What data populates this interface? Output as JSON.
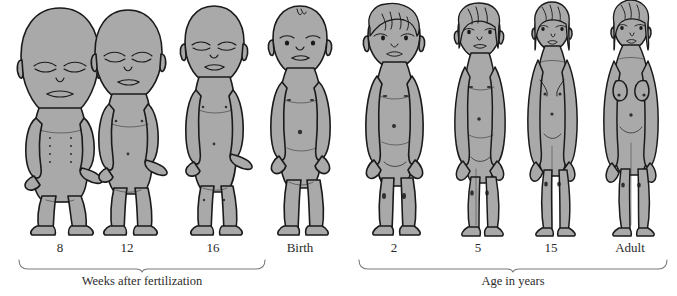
{
  "figure": {
    "background_color": "#ffffff",
    "body_fill_color": "#a9a9a9",
    "outline_color": "#1a1a1a",
    "label_color": "#2b2b2b",
    "baseline_y": 232
  },
  "stages": [
    {
      "id": "stage-8-weeks",
      "label": "8",
      "center_x": 60,
      "figure_height": 215,
      "head_ratio": 0.5,
      "type": "fetus",
      "description": "8-week fetus, head approximately half of total body length"
    },
    {
      "id": "stage-12-weeks",
      "label": "12",
      "center_x": 127,
      "figure_height": 212,
      "head_ratio": 0.4,
      "type": "fetus",
      "description": "12-week fetus"
    },
    {
      "id": "stage-16-weeks",
      "label": "16",
      "center_x": 213,
      "figure_height": 214,
      "head_ratio": 0.33,
      "type": "fetus",
      "description": "16-week fetus"
    },
    {
      "id": "stage-birth",
      "label": "Birth",
      "center_x": 300,
      "figure_height": 216,
      "head_ratio": 0.27,
      "type": "newborn",
      "description": "Newborn infant at birth"
    },
    {
      "id": "stage-2-years",
      "label": "2",
      "center_x": 394,
      "figure_height": 218,
      "head_ratio": 0.22,
      "type": "child",
      "description": "Child aged 2 years"
    },
    {
      "id": "stage-5-years",
      "label": "5",
      "center_x": 478,
      "figure_height": 219,
      "head_ratio": 0.18,
      "type": "child",
      "description": "Child aged 5 years"
    },
    {
      "id": "stage-15-years",
      "label": "15",
      "center_x": 551,
      "figure_height": 220,
      "head_ratio": 0.14,
      "type": "adolescent",
      "description": "Adolescent aged 15 years"
    },
    {
      "id": "stage-adult",
      "label": "Adult",
      "center_x": 630,
      "figure_height": 221,
      "head_ratio": 0.125,
      "type": "adult",
      "description": "Adult female"
    }
  ],
  "braces": [
    {
      "id": "brace-prenatal",
      "caption": "Weeks after fertilization",
      "start_x": 18,
      "end_x": 265,
      "caption_center_x": 142
    },
    {
      "id": "brace-postnatal",
      "caption": "Age in years",
      "start_x": 358,
      "end_x": 668,
      "caption_center_x": 513
    }
  ],
  "label_row_y": 246,
  "brace_row_y": 262,
  "caption_row_y": 278
}
